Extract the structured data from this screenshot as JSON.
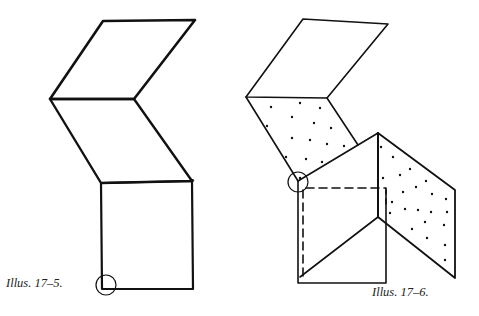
{
  "figures": [
    {
      "id": "illus-17-5",
      "caption": "Illus. 17–5.",
      "description": "Folded strip: two rhombus panels in a zigzag above a square, corner circled at bottom-left"
    },
    {
      "id": "illus-17-6",
      "caption": "Illus. 17–6.",
      "description": "Folded strip shown in 3D with dotted (reverse side) panels, dashed hidden edges, corner circled"
    }
  ],
  "colors": {
    "line": "#111111",
    "background": "#ffffff",
    "caption": "#222222"
  }
}
